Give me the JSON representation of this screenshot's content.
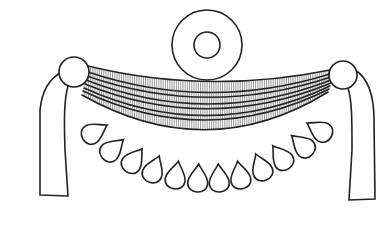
{
  "figure": {
    "width": 387,
    "height": 226,
    "colors": {
      "ink": "#222222",
      "hatch": "#555555",
      "background": "#ffffff"
    },
    "disc": {
      "cx": 207,
      "cy": 45,
      "r_outer": 35,
      "r_inner": 13
    },
    "knobs": [
      {
        "side": "left",
        "cx": 74,
        "cy": 72,
        "r": 15
      },
      {
        "side": "right",
        "cx": 343,
        "cy": 75,
        "r": 14
      }
    ],
    "straps": [
      {
        "side": "left",
        "d": "M 62 72 C 50 78, 42 90, 40 110 L 40 195 L 68 196 L 65 150 C 64 120, 64 100, 68 86"
      },
      {
        "side": "right",
        "d": "M 355 70 C 368 78, 374 95, 374 120 L 375 199 L 349 200 L 352 150 C 352 120, 352 100, 348 88"
      }
    ],
    "bands": [
      {
        "upper": "M 88 66 Q 207 95 330 70",
        "lower": "M 88 72 Q 207 112 330 74"
      },
      {
        "upper": "M 87 76 Q 207 118 331 77",
        "lower": "M 86 80 Q 208 128 331 80"
      },
      {
        "upper": "M 85 84 Q 208 134 331 83",
        "lower": "M 84 88 Q 208 144 330 86"
      },
      {
        "upper": "M 83 91 Q 208 150 329 89",
        "lower": "M 82 95 Q 208 166 328 92"
      }
    ],
    "pendants": [
      {
        "cx": 95,
        "cy": 132,
        "rot": 60
      },
      {
        "cx": 113,
        "cy": 149,
        "rot": 48
      },
      {
        "cx": 134,
        "cy": 160,
        "rot": 36
      },
      {
        "cx": 154,
        "cy": 169,
        "rot": 22
      },
      {
        "cx": 176,
        "cy": 175,
        "rot": 10
      },
      {
        "cx": 198,
        "cy": 178,
        "rot": 3
      },
      {
        "cx": 219,
        "cy": 178,
        "rot": -3
      },
      {
        "cx": 240,
        "cy": 175,
        "rot": -10
      },
      {
        "cx": 261,
        "cy": 167,
        "rot": -22
      },
      {
        "cx": 281,
        "cy": 157,
        "rot": -36
      },
      {
        "cx": 302,
        "cy": 145,
        "rot": -48
      },
      {
        "cx": 319,
        "cy": 130,
        "rot": -60
      }
    ]
  }
}
